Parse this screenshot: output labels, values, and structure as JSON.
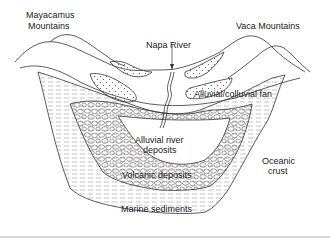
{
  "diagram": {
    "type": "geologic cross-section",
    "labels": {
      "mayacamus_line1": "Mayacamus",
      "mayacamus_line2": "Mountains",
      "vaca": "Vaca Mountains",
      "napa_river": "Napa River",
      "alluvial_fan": "Alluvial/colluvial fan",
      "alluvial_river_line1": "Alluvial river",
      "alluvial_river_line2": "deposits",
      "volcanic": "Volcanic deposits",
      "oceanic_line1": "Oceanic",
      "oceanic_line2": "crust",
      "marine": "Marine sediments"
    },
    "layers": [
      {
        "name": "Mayacamus Mountains",
        "pattern": "none"
      },
      {
        "name": "Vaca Mountains",
        "pattern": "none"
      },
      {
        "name": "Alluvial/colluvial fan",
        "pattern": "dots"
      },
      {
        "name": "Alluvial river deposits",
        "pattern": "none"
      },
      {
        "name": "Volcanic deposits",
        "pattern": "pebbles"
      },
      {
        "name": "Marine sediments",
        "pattern": "dashed-lines"
      },
      {
        "name": "Oceanic crust",
        "pattern": "none"
      }
    ],
    "colors": {
      "line": "#333333",
      "text": "#222222",
      "pattern": "#777777"
    }
  }
}
